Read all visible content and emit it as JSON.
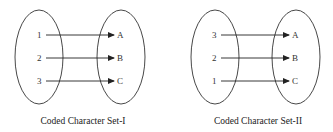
{
  "diagrams": [
    {
      "caption": "Coded Character Set-I",
      "codes": [
        "1",
        "2",
        "3"
      ],
      "characters": [
        "A",
        "B",
        "C"
      ],
      "mappings": [
        [
          "1",
          "A"
        ],
        [
          "2",
          "B"
        ],
        [
          "3",
          "C"
        ]
      ]
    },
    {
      "caption": "Coded Character Set-II",
      "codes": [
        "3",
        "2",
        "1"
      ],
      "characters": [
        "A",
        "B",
        "C"
      ],
      "mappings": [
        [
          "3",
          "A"
        ],
        [
          "2",
          "B"
        ],
        [
          "1",
          "C"
        ]
      ]
    }
  ]
}
